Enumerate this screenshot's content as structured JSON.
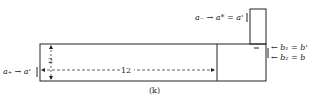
{
  "diagram": {
    "caption": "(k)",
    "labels": {
      "top_input": "a₋ → a* = a'",
      "left_input": "a₊ → a'",
      "right_b1": "← b₁ = b'",
      "right_b2": "← b₂ = b",
      "height_dim": "2",
      "width_dim": "12",
      "tick_mark": "—"
    },
    "colors": {
      "stroke": "#222222",
      "background": "#ffffff"
    }
  }
}
